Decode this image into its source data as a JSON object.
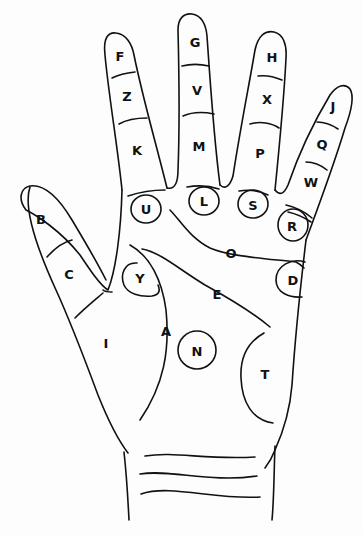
{
  "diagram": {
    "type": "palmistry-hand-chart",
    "line_color": "#111111",
    "background": "#fdfdfd",
    "labels": {
      "index_tip": "F",
      "index_mid": "Z",
      "index_base": "K",
      "middle_tip": "G",
      "middle_mid": "V",
      "middle_base": "M",
      "ring_tip": "H",
      "ring_mid": "X",
      "ring_base": "P",
      "little_tip": "J",
      "little_mid": "Q",
      "little_base": "W",
      "thumb_tip": "B",
      "thumb_mid": "C",
      "thumb_base": "I",
      "mount_index": "U",
      "mount_middle": "L",
      "mount_ring": "S",
      "mount_little": "R",
      "mount_lower_mars": "Y",
      "mount_upper_mars": "D",
      "heart_line": "O",
      "head_line": "E",
      "life_line": "A",
      "plain_of_mars": "N",
      "mount_luna": "T"
    }
  }
}
